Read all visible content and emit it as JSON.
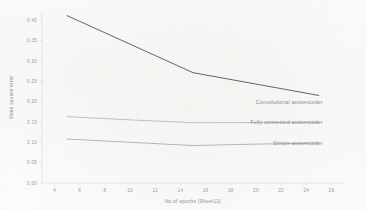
{
  "chart_data": {
    "type": "line",
    "title": "",
    "subtitle": "",
    "xlabel": "No of epochs (Sheet13)",
    "ylabel": "Mean square error",
    "xlim": [
      3,
      27
    ],
    "ylim": [
      0.0,
      0.42
    ],
    "grid": false,
    "legend_position": "inline-right-of-line-ends",
    "x_ticks": [
      4,
      6,
      8,
      10,
      12,
      14,
      16,
      18,
      20,
      22,
      24,
      26
    ],
    "x_tick_labels": [
      "4",
      "6",
      "8",
      "10",
      "12",
      "14",
      "16",
      "18",
      "20",
      "22",
      "24",
      "26"
    ],
    "y_ticks": [
      0.0,
      0.05,
      0.1,
      0.15,
      0.2,
      0.25,
      0.3,
      0.35,
      0.4
    ],
    "y_tick_labels": [
      "0.00",
      "0.05",
      "0.10",
      "0.15",
      "0.20",
      "0.25",
      "0.30",
      "0.35",
      "0.40"
    ],
    "x": [
      5,
      10,
      15,
      20,
      25
    ],
    "series": [
      {
        "name": "Convolutional autoencoder",
        "color": "#5d5d5f",
        "width": 0.95,
        "values": [
          0.411,
          0.341,
          0.271,
          0.243,
          0.215
        ]
      },
      {
        "name": "Fully connected autoencoder",
        "color": "#a8a8aa",
        "width": 0.7,
        "values": [
          0.163,
          0.155,
          0.148,
          0.1485,
          0.149
        ]
      },
      {
        "name": "Simple autoencoder",
        "color": "#9a9a9c",
        "width": 0.7,
        "values": [
          0.108,
          0.1,
          0.092,
          0.0955,
          0.098
        ]
      }
    ]
  },
  "annotations": {
    "convolutional_label": "Convolutional autoencoder",
    "fully_connected_label": "Fully connected autoencoder",
    "simple_label": "Simple autoencoder"
  }
}
